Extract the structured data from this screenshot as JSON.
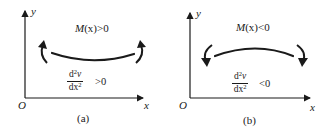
{
  "figure": {
    "panels": [
      {
        "id": "a",
        "caption": "(a)",
        "axis_y_label": "y",
        "axis_x_label": "x",
        "origin_label": "O",
        "moment_prefix": "M",
        "moment_arg": "(x)",
        "moment_condition": ">0",
        "derivative_numerator": "d",
        "derivative_numerator_sup": "2",
        "derivative_numerator_var": "v",
        "derivative_denominator": "dx",
        "derivative_denominator_sup": "2",
        "derivative_condition": ">0",
        "curvature": "concave-up",
        "moment_arrows": "upward"
      },
      {
        "id": "b",
        "caption": "(b)",
        "axis_y_label": "y",
        "axis_x_label": "x",
        "origin_label": "O",
        "moment_prefix": "M",
        "moment_arg": "(x)",
        "moment_condition": "<0",
        "derivative_numerator": "d",
        "derivative_numerator_sup": "2",
        "derivative_numerator_var": "v",
        "derivative_denominator": "dx",
        "derivative_denominator_sup": "2",
        "derivative_condition": "<0",
        "curvature": "concave-down",
        "moment_arrows": "downward"
      }
    ],
    "colors": {
      "ink": "#1a1a1a",
      "background": "#ffffff"
    }
  }
}
